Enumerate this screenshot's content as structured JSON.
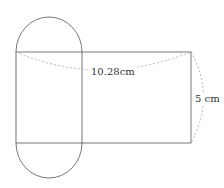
{
  "figure": {
    "labels": {
      "width": "10.28cm",
      "height": "5 cm"
    },
    "colors": {
      "stroke": "#555555",
      "dashed": "#9a9a9a"
    }
  }
}
